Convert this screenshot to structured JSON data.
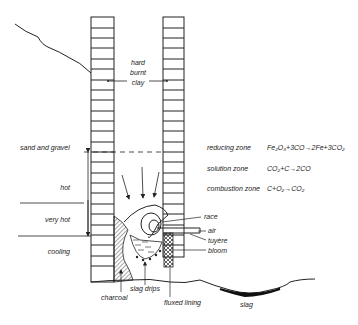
{
  "diagram": {
    "type": "bloomery furnace cross-section",
    "wall_label": [
      "hard",
      "burnt",
      "clay"
    ],
    "left_labels": {
      "sand_and_gravel": "sand and gravel",
      "hot": "hot",
      "very_hot": "very hot",
      "cooling": "cooling"
    },
    "zones": [
      {
        "name": "reducing zone",
        "reaction": "Fe₂O₃+3CO→2Fe+3CO₂"
      },
      {
        "name": "solution zone",
        "reaction": "CO₂+C→2CO"
      },
      {
        "name": "combustion zone",
        "reaction": "C+O₂→CO₂"
      }
    ],
    "right_labels": {
      "race": "race",
      "air": "air",
      "tuyere": "tuyère",
      "bloom": "bloom"
    },
    "bottom_labels": {
      "charcoal": "charcoal",
      "slag_drips": "slag drips",
      "fluxed_lining": "fluxed lining",
      "slag": "slag"
    },
    "colors": {
      "ink": "#222222",
      "background": "#ffffff"
    }
  }
}
